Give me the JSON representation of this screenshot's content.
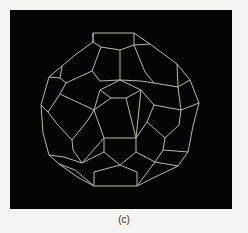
{
  "figure": {
    "caption": "(c)",
    "background_color": "#050505",
    "line_color": "#b8b8b0",
    "page_color": "#f4f4f2"
  }
}
